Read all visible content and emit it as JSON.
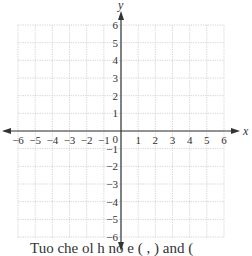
{
  "diagram": {
    "type": "coordinate-plane",
    "x_axis": {
      "label": "x",
      "min": -6,
      "max": 6,
      "ticks": [
        "-6",
        "-5",
        "-4",
        "-3",
        "-2",
        "-1",
        "1",
        "2",
        "3",
        "4",
        "5",
        "6"
      ]
    },
    "y_axis": {
      "label": "y",
      "min": -6,
      "max": 6,
      "ticks": [
        "6",
        "5",
        "4",
        "3",
        "2",
        "1",
        "-1",
        "-2",
        "-3",
        "-4",
        "-5",
        "-6"
      ]
    },
    "origin_label": "0",
    "grid": {
      "style": "dotted",
      "color": "#c8c8c8"
    },
    "axis_color": "#333333",
    "text_color": "#333333"
  },
  "caption": {
    "text": "Tuo  che ol  h   no  e    (   , ) and ("
  }
}
